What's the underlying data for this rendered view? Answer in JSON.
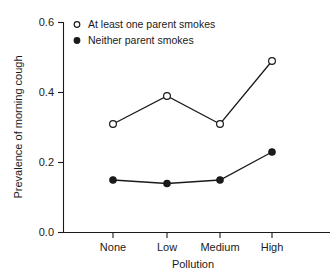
{
  "chart_data": {
    "type": "line",
    "title": "",
    "xlabel": "Pollution",
    "ylabel": "Prevalence of morning cough",
    "categories": [
      "None",
      "Low",
      "Medium",
      "High"
    ],
    "ylim": [
      0.0,
      0.6
    ],
    "yticks": [
      "0.0",
      "0.2",
      "0.4",
      "0.6"
    ],
    "ytick_values": [
      0.0,
      0.2,
      0.4,
      0.6
    ],
    "grid": false,
    "legend_position": "top-left",
    "series": [
      {
        "name": "At least one parent smokes",
        "marker": "open-circle",
        "values": [
          0.31,
          0.39,
          0.31,
          0.49
        ]
      },
      {
        "name": "Neither parent smokes",
        "marker": "filled-circle",
        "values": [
          0.15,
          0.14,
          0.15,
          0.23
        ]
      }
    ]
  },
  "axis": {
    "y_title": "Prevalence of morning cough",
    "x_title": "Pollution",
    "y_tick_0": "0.0",
    "y_tick_1": "0.2",
    "y_tick_2": "0.4",
    "y_tick_3": "0.6",
    "x_tick_0": "None",
    "x_tick_1": "Low",
    "x_tick_2": "Medium",
    "x_tick_3": "High"
  },
  "legend": {
    "entry_0": "At least one parent smokes",
    "entry_1": "Neither parent smokes"
  },
  "colors": {
    "ink": "#1a1a1a",
    "background": "#ffffff"
  }
}
